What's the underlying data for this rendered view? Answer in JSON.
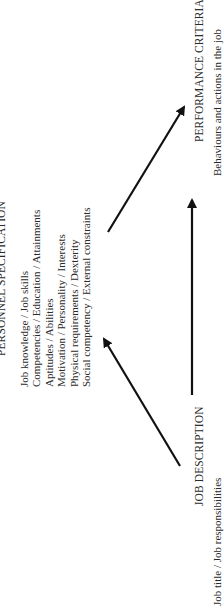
{
  "diagram": {
    "nodes": {
      "personnel_specification": {
        "title": "PERSONNEL SPECIFICATION",
        "items": [
          "Job knowledge / Job skills",
          "Competencies / Education / Attainments",
          "Aptitudes / Abilities",
          "Motivation / Personality / Interests",
          "Physical requirements / Dexterity",
          "Social competency / External constraints"
        ]
      },
      "job_description": {
        "title": "JOB DESCRIPTION",
        "subtitle": "Job title / Job responsibilities"
      },
      "performance_criteria": {
        "title": "PERFORMANCE CRITERIA",
        "subtitle": "Behaviours and actions in the job"
      }
    },
    "edges": [
      {
        "from": "job_description",
        "to": "personnel_specification"
      },
      {
        "from": "job_description",
        "to": "performance_criteria"
      },
      {
        "from": "personnel_specification",
        "to": "performance_criteria"
      }
    ],
    "orientation": "rotated 90 degrees counter-clockwise",
    "colors": {
      "text": "#2a2a2a",
      "arrow": "#111111",
      "background": "#ffffff"
    }
  }
}
